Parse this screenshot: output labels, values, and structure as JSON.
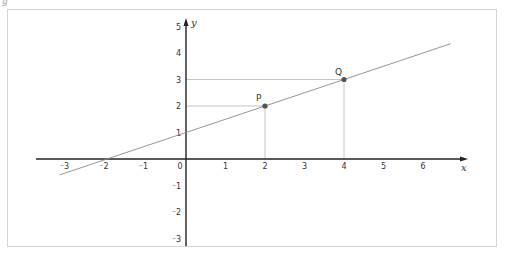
{
  "figure": {
    "corner_label": "g"
  },
  "chart_data": {
    "type": "line",
    "title": "",
    "xlabel": "x",
    "ylabel": "y",
    "xlim": [
      -3.8,
      7
    ],
    "ylim": [
      -3.2,
      5.3
    ],
    "grid": false,
    "x_ticks": [
      "-3",
      "-2",
      "-1",
      "0",
      "1",
      "2",
      "3",
      "4",
      "5",
      "6"
    ],
    "y_ticks": [
      "-3",
      "-2",
      "-1",
      "1",
      "2",
      "3",
      "4",
      "5"
    ],
    "x_tick_labels": [
      "⁻3",
      "⁻2",
      "⁻1",
      "0",
      "1",
      "2",
      "3",
      "4",
      "5",
      "6"
    ],
    "y_tick_labels": [
      "⁻3",
      "⁻2",
      "⁻1",
      "1",
      "2",
      "3",
      "4",
      "5"
    ],
    "line": {
      "equation": "y = 0.5x + 1",
      "slope": 0.5,
      "intercept": 1,
      "x_range": [
        -3.2,
        6.7
      ],
      "color": "#888888"
    },
    "points": [
      {
        "label": "P",
        "x": 2,
        "y": 2
      },
      {
        "label": "Q",
        "x": 4,
        "y": 3
      }
    ],
    "guides": "dashed-free thin projection lines from P and Q to both axes",
    "x_intercept": {
      "x": -2,
      "y": 0
    }
  },
  "colors": {
    "axis": "#222222",
    "line": "#8a8a8a",
    "guide": "#b5b5b5",
    "point": "#555555",
    "frame": "#d6d6d6"
  }
}
